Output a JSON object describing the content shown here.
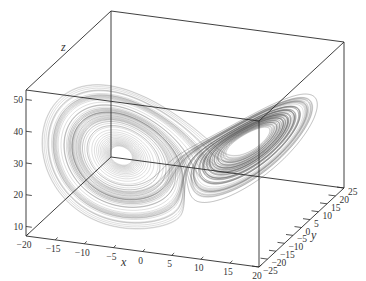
{
  "chart_data": {
    "type": "line3d",
    "title": "",
    "xlabel": "x",
    "ylabel": "y",
    "zlabel": "z",
    "xlim": [
      -20,
      20
    ],
    "ylim": [
      -25,
      25
    ],
    "zlim": [
      7,
      53
    ],
    "x_ticks": [
      -20,
      -15,
      -10,
      -5,
      0,
      5,
      10,
      15,
      20
    ],
    "y_ticks": [
      -25,
      -20,
      -15,
      -10,
      -5,
      0,
      5,
      10,
      15,
      20,
      25
    ],
    "z_ticks": [
      10,
      20,
      30,
      40,
      50
    ],
    "x_tick_labels": [
      "-20",
      "-15",
      "-10",
      "-5",
      "0",
      "5",
      "10",
      "15",
      "20"
    ],
    "y_tick_labels": [
      "-25",
      "-20",
      "-15",
      "-10",
      "-5",
      "0",
      "5",
      "10",
      "15",
      "20",
      "25"
    ],
    "z_tick_labels": [
      "10",
      "20",
      "30",
      "40",
      "50"
    ],
    "grid": false,
    "legend": null,
    "series": [
      {
        "name": "Lorenz trajectory",
        "system": "Lorenz",
        "parameters": {
          "sigma": 10,
          "rho": 28,
          "beta": 2.6667
        },
        "color": "#555555"
      }
    ]
  },
  "axes": {
    "x_label": "x",
    "y_label": "y",
    "z_label": "z"
  }
}
